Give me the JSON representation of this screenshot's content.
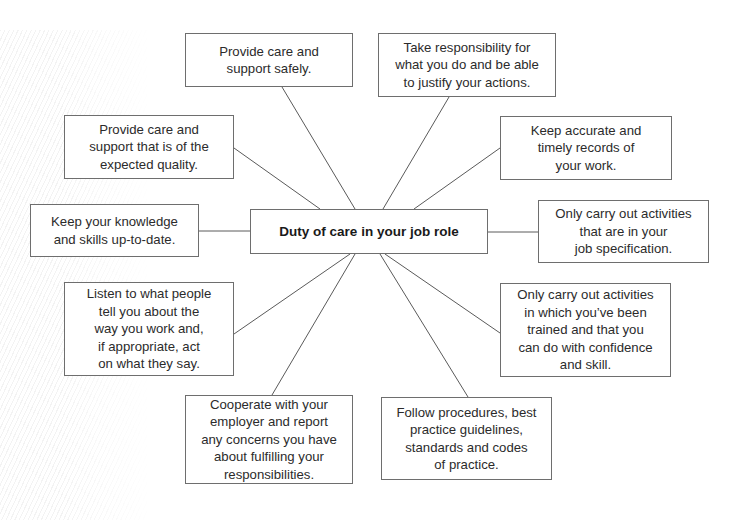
{
  "diagram": {
    "type": "mind-map",
    "center": {
      "label": "Duty of care in your job role"
    },
    "nodes": [
      {
        "id": "safely",
        "label": "Provide care and\nsupport safely."
      },
      {
        "id": "responsibility",
        "label": "Take responsibility for\nwhat you do and be able\nto justify your actions."
      },
      {
        "id": "quality",
        "label": "Provide care and\nsupport that is of the\nexpected quality."
      },
      {
        "id": "records",
        "label": "Keep accurate and\ntimely records of\nyour work."
      },
      {
        "id": "knowledge",
        "label": "Keep your knowledge\nand skills up-to-date."
      },
      {
        "id": "job-spec",
        "label": "Only carry out activities\nthat are in your\njob specification."
      },
      {
        "id": "listen",
        "label": "Listen to what people\ntell you about the\nway you work and,\nif appropriate, act\non what they say."
      },
      {
        "id": "trained",
        "label": "Only carry out activities\nin which you’ve been\ntrained and that you\ncan do with confidence\nand skill."
      },
      {
        "id": "cooperate",
        "label": "Cooperate with your\nemployer and report\nany concerns you have\nabout fulfilling your\nresponsibilities."
      },
      {
        "id": "procedures",
        "label": "Follow procedures, best\npractice guidelines,\nstandards and codes\nof practice."
      }
    ],
    "colors": {
      "border": "#6e6e6e",
      "line": "#5a5a5a",
      "text": "#2b2b2b",
      "background": "#ffffff"
    }
  }
}
